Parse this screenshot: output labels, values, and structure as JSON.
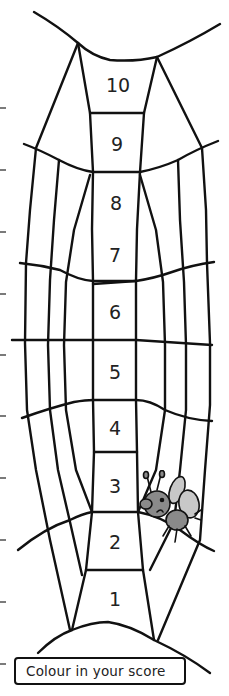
{
  "worksheet": {
    "type": "score-tracker",
    "theme": "spider-web",
    "scores": [
      "10",
      "9",
      "8",
      "7",
      "6",
      "5",
      "4",
      "3",
      "2",
      "1"
    ],
    "instruction_label": "Colour in your score",
    "decoration": "fly-icon",
    "tick_count": 10,
    "colors": {
      "line": "#111111",
      "text": "#222222",
      "fly_body": "#8a8a8a",
      "fly_wing": "#c8c8c8",
      "background": "#ffffff"
    }
  }
}
